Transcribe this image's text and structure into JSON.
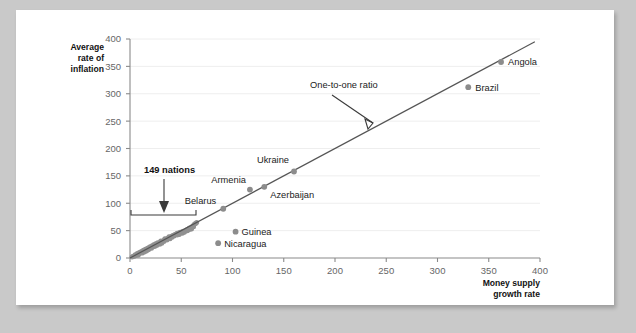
{
  "chart_data": {
    "type": "scatter",
    "title": "",
    "xlabel": "Money supply growth rate",
    "ylabel": "Average rate of inflation",
    "xlim": [
      0,
      400
    ],
    "ylim": [
      0,
      400
    ],
    "xticks": [
      0,
      50,
      100,
      150,
      200,
      250,
      300,
      350,
      400
    ],
    "yticks": [
      0,
      50,
      100,
      150,
      200,
      250,
      300,
      350,
      400
    ],
    "grid": true,
    "legend": "none",
    "annotations": [
      {
        "text": "One-to-one ratio",
        "x": 175,
        "y": 330,
        "note": "arrow points down-right to the 45-degree reference line"
      },
      {
        "text": "149 nations",
        "x": 35,
        "y": 180,
        "note": "arrow points down to bracket spanning x 0 to 65"
      }
    ],
    "reference_line": {
      "name": "One-to-one ratio",
      "from": [
        0,
        0
      ],
      "to": [
        395,
        395
      ],
      "slope": 1
    },
    "labeled_points": [
      {
        "label": "Belarus",
        "x": 91,
        "y": 90
      },
      {
        "label": "Armenia",
        "x": 117,
        "y": 125
      },
      {
        "label": "Azerbaijan",
        "x": 131,
        "y": 130
      },
      {
        "label": "Ukraine",
        "x": 160,
        "y": 158
      },
      {
        "label": "Guinea",
        "x": 103,
        "y": 48
      },
      {
        "label": "Nicaragua",
        "x": 86,
        "y": 27
      },
      {
        "label": "Brazil",
        "x": 330,
        "y": 312
      },
      {
        "label": "Angola",
        "x": 362,
        "y": 358
      }
    ],
    "cluster_points": [
      {
        "x": 2,
        "y": 2
      },
      {
        "x": 3,
        "y": 3
      },
      {
        "x": 4,
        "y": 3
      },
      {
        "x": 5,
        "y": 4
      },
      {
        "x": 5,
        "y": 6
      },
      {
        "x": 6,
        "y": 5
      },
      {
        "x": 7,
        "y": 6
      },
      {
        "x": 7,
        "y": 8
      },
      {
        "x": 8,
        "y": 7
      },
      {
        "x": 9,
        "y": 8
      },
      {
        "x": 9,
        "y": 10
      },
      {
        "x": 10,
        "y": 9
      },
      {
        "x": 11,
        "y": 10
      },
      {
        "x": 11,
        "y": 12
      },
      {
        "x": 12,
        "y": 11
      },
      {
        "x": 13,
        "y": 12
      },
      {
        "x": 13,
        "y": 14
      },
      {
        "x": 14,
        "y": 13
      },
      {
        "x": 15,
        "y": 14
      },
      {
        "x": 15,
        "y": 16
      },
      {
        "x": 16,
        "y": 15
      },
      {
        "x": 17,
        "y": 16
      },
      {
        "x": 17,
        "y": 18
      },
      {
        "x": 18,
        "y": 17
      },
      {
        "x": 19,
        "y": 18
      },
      {
        "x": 19,
        "y": 20
      },
      {
        "x": 20,
        "y": 19
      },
      {
        "x": 21,
        "y": 20
      },
      {
        "x": 21,
        "y": 22
      },
      {
        "x": 22,
        "y": 21
      },
      {
        "x": 23,
        "y": 22
      },
      {
        "x": 23,
        "y": 24
      },
      {
        "x": 24,
        "y": 23
      },
      {
        "x": 25,
        "y": 24
      },
      {
        "x": 25,
        "y": 26
      },
      {
        "x": 26,
        "y": 25
      },
      {
        "x": 27,
        "y": 26
      },
      {
        "x": 27,
        "y": 28
      },
      {
        "x": 28,
        "y": 27
      },
      {
        "x": 29,
        "y": 28
      },
      {
        "x": 30,
        "y": 29
      },
      {
        "x": 30,
        "y": 31
      },
      {
        "x": 31,
        "y": 30
      },
      {
        "x": 32,
        "y": 31
      },
      {
        "x": 33,
        "y": 32
      },
      {
        "x": 34,
        "y": 33
      },
      {
        "x": 34,
        "y": 35
      },
      {
        "x": 35,
        "y": 34
      },
      {
        "x": 36,
        "y": 35
      },
      {
        "x": 37,
        "y": 36
      },
      {
        "x": 38,
        "y": 37
      },
      {
        "x": 38,
        "y": 39
      },
      {
        "x": 39,
        "y": 38
      },
      {
        "x": 40,
        "y": 39
      },
      {
        "x": 41,
        "y": 40
      },
      {
        "x": 42,
        "y": 41
      },
      {
        "x": 43,
        "y": 42
      },
      {
        "x": 44,
        "y": 43
      },
      {
        "x": 45,
        "y": 44
      },
      {
        "x": 46,
        "y": 45
      },
      {
        "x": 47,
        "y": 44
      },
      {
        "x": 48,
        "y": 46
      },
      {
        "x": 49,
        "y": 47
      },
      {
        "x": 50,
        "y": 46
      },
      {
        "x": 51,
        "y": 48
      },
      {
        "x": 52,
        "y": 49
      },
      {
        "x": 53,
        "y": 48
      },
      {
        "x": 54,
        "y": 50
      },
      {
        "x": 55,
        "y": 51
      },
      {
        "x": 56,
        "y": 52
      },
      {
        "x": 57,
        "y": 53
      },
      {
        "x": 58,
        "y": 55
      },
      {
        "x": 59,
        "y": 54
      },
      {
        "x": 60,
        "y": 56
      },
      {
        "x": 61,
        "y": 58
      },
      {
        "x": 62,
        "y": 60
      },
      {
        "x": 63,
        "y": 62
      },
      {
        "x": 64,
        "y": 63
      },
      {
        "x": 65,
        "y": 65
      },
      {
        "x": 12,
        "y": 9
      },
      {
        "x": 16,
        "y": 13
      },
      {
        "x": 21,
        "y": 18
      },
      {
        "x": 26,
        "y": 23
      },
      {
        "x": 31,
        "y": 27
      },
      {
        "x": 36,
        "y": 33
      },
      {
        "x": 41,
        "y": 38
      },
      {
        "x": 46,
        "y": 42
      },
      {
        "x": 51,
        "y": 45
      },
      {
        "x": 56,
        "y": 50
      },
      {
        "x": 60,
        "y": 53
      },
      {
        "x": 8,
        "y": 5
      },
      {
        "x": 14,
        "y": 11
      },
      {
        "x": 18,
        "y": 15
      },
      {
        "x": 24,
        "y": 21
      },
      {
        "x": 29,
        "y": 25
      },
      {
        "x": 33,
        "y": 30
      },
      {
        "x": 39,
        "y": 35
      },
      {
        "x": 43,
        "y": 40
      },
      {
        "x": 48,
        "y": 43
      },
      {
        "x": 53,
        "y": 47
      },
      {
        "x": 58,
        "y": 52
      },
      {
        "x": 62,
        "y": 57
      }
    ]
  },
  "axes": {
    "y_title_lines": [
      "Average",
      "rate of",
      "inflation"
    ],
    "x_title_lines": [
      "Money supply",
      "growth rate"
    ],
    "x_tick_labels": [
      "0",
      "50",
      "100",
      "150",
      "200",
      "250",
      "300",
      "350",
      "400"
    ],
    "y_tick_labels": [
      "0",
      "50",
      "100",
      "150",
      "200",
      "250",
      "300",
      "350",
      "400"
    ]
  },
  "annotations": {
    "one_to_one": "One-to-one ratio",
    "nations": "149 nations"
  },
  "colors": {
    "point": "#8c8c8c",
    "line": "#555555",
    "grid": "#eeeeee",
    "axis": "#8a8a8a",
    "text": "#222222",
    "tick_text": "#666666",
    "card": "#ffffff",
    "page": "#c9c9c9"
  }
}
